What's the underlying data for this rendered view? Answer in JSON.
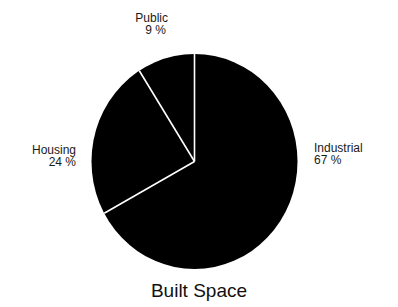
{
  "chart_data": {
    "type": "pie",
    "title": "Built Space",
    "categories": [
      "Industrial",
      "Housing",
      "Public"
    ],
    "values": [
      67,
      24,
      9
    ],
    "labels": [
      "67%",
      "24%",
      "9%"
    ],
    "start_angle_deg": 0,
    "direction": "clockwise",
    "colors": {
      "fill": "#000000",
      "separator": "#ffffff"
    },
    "legend": "none",
    "slice_labels_outside": true
  },
  "labels": {
    "public": {
      "name": "Public",
      "pct": "9 %"
    },
    "housing": {
      "name": "Housing",
      "pct": "24 %"
    },
    "industrial": {
      "name": "Industrial",
      "pct": "67 %"
    }
  }
}
